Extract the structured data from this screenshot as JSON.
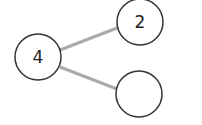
{
  "diagram": {
    "type": "number-bond",
    "whole": {
      "value": "4"
    },
    "parts": [
      {
        "value": "2"
      },
      {
        "value": ""
      }
    ],
    "colors": {
      "circle_stroke": "#333333",
      "connector": "#aaaaaa",
      "background": "#ffffff"
    }
  }
}
